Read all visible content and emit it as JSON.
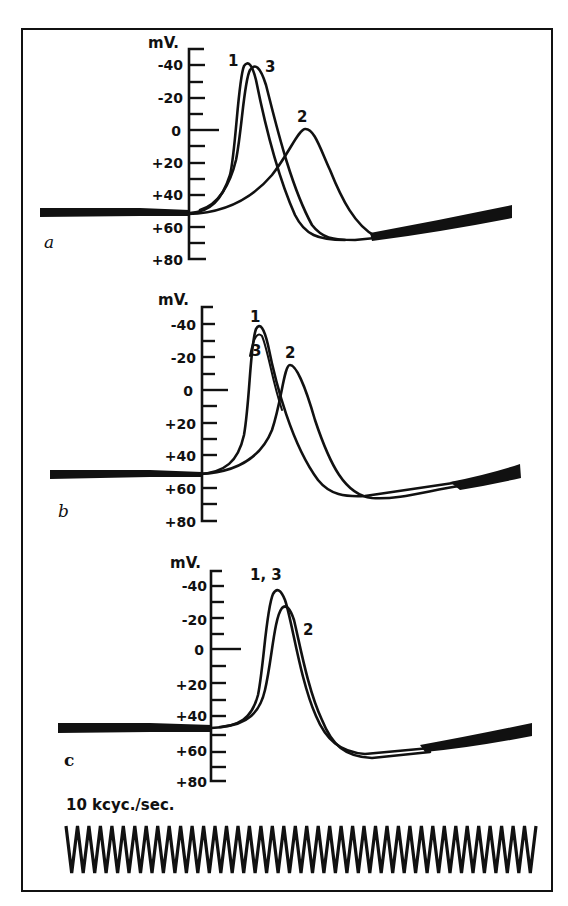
{
  "chart_data": [
    {
      "type": "line",
      "panel": "a",
      "ylabel": "mV.",
      "yticks": [
        "-40",
        "-20",
        "0",
        "+20",
        "+40",
        "+60",
        "+80"
      ],
      "ylim": [
        -50,
        80
      ],
      "y_axis_inverted": true,
      "grid": false,
      "series": [
        {
          "name": "1",
          "peak_mV": -40,
          "baseline_mV": 50,
          "undershoot_mV": 66,
          "note": "earliest, fastest rising spike"
        },
        {
          "name": "2",
          "peak_mV": -2,
          "baseline_mV": 50,
          "undershoot_mV": 66,
          "note": "delayed, broader, smaller spike"
        },
        {
          "name": "3",
          "peak_mV": -37,
          "baseline_mV": 50,
          "undershoot_mV": 66,
          "note": "slightly later than 1"
        }
      ]
    },
    {
      "type": "line",
      "panel": "b",
      "ylabel": "mV.",
      "yticks": [
        "-40",
        "-20",
        "0",
        "+20",
        "+40",
        "+60",
        "+80"
      ],
      "ylim": [
        -50,
        80
      ],
      "y_axis_inverted": true,
      "grid": false,
      "series": [
        {
          "name": "1",
          "peak_mV": -37,
          "baseline_mV": 50,
          "undershoot_mV": 65
        },
        {
          "name": "3",
          "peak_mV": -35,
          "baseline_mV": 50,
          "undershoot_mV": 65,
          "note": "superimposed on 1"
        },
        {
          "name": "2",
          "peak_mV": -16,
          "baseline_mV": 50,
          "undershoot_mV": 67,
          "note": "delayed spike"
        }
      ]
    },
    {
      "type": "line",
      "panel": "c",
      "ylabel": "mV.",
      "yticks": [
        "-40",
        "-20",
        "0",
        "+20",
        "+40",
        "+60",
        "+80"
      ],
      "ylim": [
        -50,
        80
      ],
      "y_axis_inverted": true,
      "grid": false,
      "series": [
        {
          "name": "1, 3",
          "peak_mV": -37,
          "baseline_mV": 50,
          "undershoot_mV": 62
        },
        {
          "name": "2",
          "peak_mV": -28,
          "baseline_mV": 50,
          "undershoot_mV": 63,
          "note": "nearly coincident with 1,3"
        }
      ]
    }
  ],
  "figure": {
    "panels": [
      {
        "id": "a",
        "label": "a",
        "curve_labels": [
          "1",
          "3",
          "2"
        ]
      },
      {
        "id": "b",
        "label": "b",
        "curve_labels": [
          "1",
          "3",
          "2"
        ]
      },
      {
        "id": "c",
        "label": "c",
        "curve_labels": [
          "1, 3",
          "2"
        ]
      }
    ],
    "unit_label": "mV.",
    "ticks": [
      "-40",
      "-20",
      "0",
      "+20",
      "+40",
      "+60",
      "+80"
    ],
    "calibration": {
      "label": "10 kcyc./sec.",
      "cycles": 41
    }
  }
}
